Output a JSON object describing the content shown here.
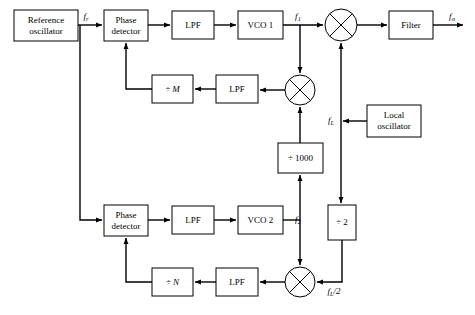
{
  "diagram": {
    "colors": {
      "line": "#000000",
      "background": "#ffffff",
      "box_fill": "#ffffff"
    },
    "blocks": [
      {
        "id": "ref_osc",
        "label_line1": "Reference",
        "label_line2": "oscillator",
        "x": 14,
        "y": 10,
        "w": 64,
        "h": 31
      },
      {
        "id": "pd_top",
        "label_line1": "Phase",
        "label_line2": "detector",
        "x": 104,
        "y": 10,
        "w": 44,
        "h": 31
      },
      {
        "id": "lpf_top",
        "label_line1": "LPF",
        "label_line2": "",
        "x": 172,
        "y": 11,
        "w": 42,
        "h": 28
      },
      {
        "id": "vco1",
        "label_line1": "VCO 1",
        "label_line2": "",
        "x": 238,
        "y": 11,
        "w": 45,
        "h": 28
      },
      {
        "id": "filter",
        "label_line1": "Filter",
        "label_line2": "",
        "x": 389,
        "y": 11,
        "w": 44,
        "h": 28
      },
      {
        "id": "div_m",
        "label_line1": "÷ M",
        "label_line2": "",
        "x": 152,
        "y": 75,
        "w": 41,
        "h": 28
      },
      {
        "id": "lpf_m",
        "label_line1": "LPF",
        "label_line2": "",
        "x": 216,
        "y": 75,
        "w": 42,
        "h": 28
      },
      {
        "id": "local_osc",
        "label_line1": "Local",
        "label_line2": "oscillator",
        "x": 367,
        "y": 105,
        "w": 54,
        "h": 32
      },
      {
        "id": "div_1000",
        "label_line1": "÷ 1000",
        "label_line2": "",
        "x": 278,
        "y": 143,
        "w": 45,
        "h": 30
      },
      {
        "id": "pd_bot",
        "label_line1": "Phase",
        "label_line2": "detector",
        "x": 104,
        "y": 205,
        "w": 44,
        "h": 31
      },
      {
        "id": "lpf_bot",
        "label_line1": "LPF",
        "label_line2": "",
        "x": 172,
        "y": 206,
        "w": 42,
        "h": 28
      },
      {
        "id": "vco2",
        "label_line1": "VCO 2",
        "label_line2": "",
        "x": 238,
        "y": 206,
        "w": 45,
        "h": 28
      },
      {
        "id": "div_2",
        "label_line1": "÷ 2",
        "label_line2": "",
        "x": 328,
        "y": 205,
        "w": 28,
        "h": 35
      },
      {
        "id": "div_n",
        "label_line1": "÷ N",
        "label_line2": "",
        "x": 152,
        "y": 268,
        "w": 41,
        "h": 28
      },
      {
        "id": "lpf_n",
        "label_line1": "LPF",
        "label_line2": "",
        "x": 216,
        "y": 268,
        "w": 42,
        "h": 28
      }
    ],
    "mixers": [
      {
        "id": "mixer_out",
        "cx": 341,
        "cy": 25,
        "r": 16
      },
      {
        "id": "mixer_mid",
        "cx": 300,
        "cy": 90,
        "r": 15
      },
      {
        "id": "mixer_bot",
        "cx": 300,
        "cy": 282,
        "r": 15
      }
    ],
    "signals": [
      {
        "id": "f_r",
        "base": "f",
        "sub": "r",
        "x": 88,
        "y": 17
      },
      {
        "id": "f_1",
        "base": "f",
        "sub": "1",
        "x": 300,
        "y": 17
      },
      {
        "id": "f_o",
        "base": "f",
        "sub": "o",
        "x": 452,
        "y": 17
      },
      {
        "id": "f_L",
        "base": "f",
        "sub": "L",
        "x": 333,
        "y": 122
      },
      {
        "id": "f_2",
        "base": "f",
        "sub": "2",
        "x": 300,
        "y": 220
      },
      {
        "id": "f_L_2",
        "base": "f",
        "sub": "L",
        "suffix": "/2",
        "x": 332,
        "y": 292
      }
    ]
  }
}
